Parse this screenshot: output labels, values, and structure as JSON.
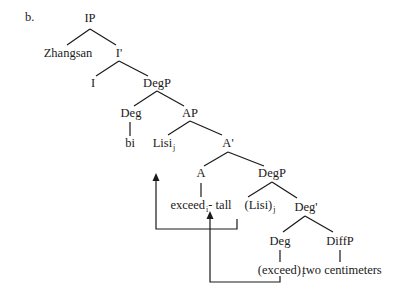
{
  "example_label": "b.",
  "nodes": {
    "ip": "IP",
    "zhangsan": "Zhangsan",
    "ibar": "I'",
    "i": "I",
    "degp1": "DegP",
    "deg1": "Deg",
    "ap": "AP",
    "bi": "bi",
    "lisi": "Lisi",
    "lisi_sub": "j",
    "abar": "A'",
    "a": "A",
    "degp2": "DegP",
    "exceed_tall_1": "exceed",
    "exceed_tall_sub": "i",
    "exceed_tall_2": "- tall",
    "lisi_trace": "(Lisi)",
    "lisi_trace_sub": "j",
    "degbar": "Deg'",
    "deg2": "Deg",
    "diffp": "DiffP",
    "exceed_trace": "(exceed)",
    "exceed_trace_sub": "i",
    "two_cm": "two centimeters"
  },
  "colors": {
    "line": "#1a1a1a",
    "background": "#ffffff"
  }
}
